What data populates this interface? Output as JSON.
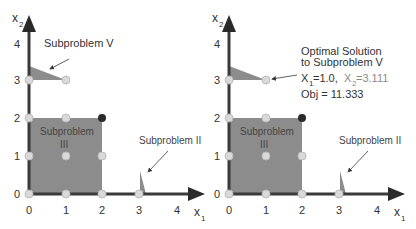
{
  "colors": {
    "axis": "#3a3a3a",
    "region_fill": "#8c8c8c",
    "point_fill": "#d9d9d9",
    "point_stroke": "#bdbdbd",
    "optimal_point": "#2a2a2a",
    "text": "#333333",
    "muted_text": "#8a8a8a"
  },
  "left_panel": {
    "y_axis_label": "x",
    "y_axis_sub": "2",
    "x_axis_label": "x",
    "x_axis_sub": "1",
    "x_ticks": [
      "0",
      "1",
      "2",
      "3",
      "4"
    ],
    "y_ticks": [
      "0",
      "1",
      "2",
      "3",
      "4"
    ],
    "label_subproblem_v": "Subproblem V",
    "label_subproblem_iii_line1": "Subproblem",
    "label_subproblem_iii_line2": "III",
    "label_subproblem_ii": "Subproblem II"
  },
  "right_panel": {
    "y_axis_label": "x",
    "y_axis_sub": "2",
    "x_axis_label": "x",
    "x_axis_sub": "1",
    "x_ticks": [
      "0",
      "1",
      "2",
      "3",
      "4"
    ],
    "y_ticks": [
      "0",
      "1",
      "2",
      "3",
      "4"
    ],
    "annotation_line1": "Optimal Solution",
    "annotation_line2": "to Subproblem V",
    "x1_label": "X",
    "x1_sub": "1",
    "x1_value": "=1.0,",
    "x2_label": "X",
    "x2_sub": "2",
    "x2_value": "=3.111",
    "objective": "Obj = 11.333",
    "label_subproblem_iii_line1": "Subproblem",
    "label_subproblem_iii_line2": "III",
    "label_subproblem_ii": "Subproblem II"
  }
}
